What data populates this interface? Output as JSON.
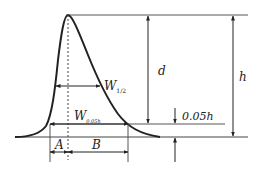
{
  "diagram": {
    "labels": {
      "d": "d",
      "h": "h",
      "w_half": "W",
      "w_half_sub": "1/2",
      "w_005": "W",
      "w_005_sub": "0.05h",
      "fraction": "0.05h",
      "A": "A",
      "B": "B"
    },
    "colors": {
      "line": "#222222",
      "guide": "#555555",
      "background": "#ffffff"
    }
  }
}
